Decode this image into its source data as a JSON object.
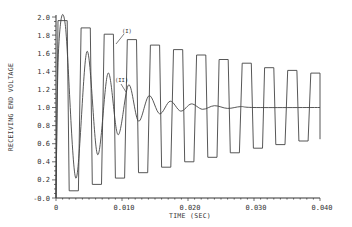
{
  "chart_data": {
    "type": "line",
    "title": "",
    "xlabel": "TIME (SEC)",
    "ylabel": "RECEIVING END VOLTAGE",
    "xlim": [
      0,
      0.04
    ],
    "ylim": [
      0.0,
      2.0
    ],
    "xticks": [
      "0",
      "0.010",
      "0.020",
      "0.030",
      "0.040"
    ],
    "xtick_values": [
      0,
      0.01,
      0.02,
      0.03,
      0.04
    ],
    "yticks": [
      "-0.0",
      "0.2",
      "0.4",
      "0.6",
      "0.8",
      "1.0",
      "1.2",
      "1.4",
      "1.6",
      "1.8",
      "2.0"
    ],
    "ytick_values": [
      0.0,
      0.2,
      0.4,
      0.6,
      0.8,
      1.0,
      1.2,
      1.4,
      1.6,
      1.8,
      2.0
    ],
    "grid": false,
    "legend": "none (inline annotations)",
    "annotations": [
      {
        "text": "(I)",
        "x": 0.0109,
        "y": 1.85,
        "points_to": "series I"
      },
      {
        "text": "(II)",
        "x": 0.011,
        "y": 1.27,
        "points_to": "series II"
      }
    ],
    "series": [
      {
        "name": "(I)",
        "description": "Undamped square-wave-like oscillation between high and low levels, slowly decaying toward 1.0",
        "period_sec": 0.00347,
        "peaks": [
          {
            "t": 0.001,
            "v": 1.96
          },
          {
            "t": 0.0045,
            "v": 1.88
          },
          {
            "t": 0.008,
            "v": 1.81
          },
          {
            "t": 0.0115,
            "v": 1.75
          },
          {
            "t": 0.015,
            "v": 1.69
          },
          {
            "t": 0.0185,
            "v": 1.64
          },
          {
            "t": 0.022,
            "v": 1.58
          },
          {
            "t": 0.0254,
            "v": 1.53
          },
          {
            "t": 0.0289,
            "v": 1.49
          },
          {
            "t": 0.0323,
            "v": 1.44
          },
          {
            "t": 0.0358,
            "v": 1.41
          },
          {
            "t": 0.0393,
            "v": 1.38
          }
        ],
        "troughs": [
          {
            "t": 0.0027,
            "v": 0.08
          },
          {
            "t": 0.0062,
            "v": 0.15
          },
          {
            "t": 0.0097,
            "v": 0.22
          },
          {
            "t": 0.0132,
            "v": 0.28
          },
          {
            "t": 0.0167,
            "v": 0.34
          },
          {
            "t": 0.0202,
            "v": 0.4
          },
          {
            "t": 0.0237,
            "v": 0.45
          },
          {
            "t": 0.0271,
            "v": 0.5
          },
          {
            "t": 0.0306,
            "v": 0.55
          },
          {
            "t": 0.034,
            "v": 0.59
          },
          {
            "t": 0.0375,
            "v": 0.63
          }
        ],
        "end": {
          "t": 0.04,
          "v": 0.65
        }
      },
      {
        "name": "(II)",
        "description": "Damped oscillation settling to 1.0",
        "points": [
          {
            "t": 0.0,
            "v": 0.0
          },
          {
            "t": 0.0004,
            "v": 1.65
          },
          {
            "t": 0.0014,
            "v": 1.92
          },
          {
            "t": 0.003,
            "v": 0.22
          },
          {
            "t": 0.0047,
            "v": 1.62
          },
          {
            "t": 0.0063,
            "v": 0.48
          },
          {
            "t": 0.0079,
            "v": 1.38
          },
          {
            "t": 0.0094,
            "v": 0.7
          },
          {
            "t": 0.011,
            "v": 1.25
          },
          {
            "t": 0.0125,
            "v": 0.85
          },
          {
            "t": 0.0141,
            "v": 1.13
          },
          {
            "t": 0.0157,
            "v": 0.93
          },
          {
            "t": 0.0173,
            "v": 1.07
          },
          {
            "t": 0.0189,
            "v": 0.96
          },
          {
            "t": 0.0205,
            "v": 1.04
          },
          {
            "t": 0.0222,
            "v": 0.98
          },
          {
            "t": 0.024,
            "v": 1.02
          },
          {
            "t": 0.026,
            "v": 0.99
          },
          {
            "t": 0.028,
            "v": 1.01
          },
          {
            "t": 0.03,
            "v": 1.0
          },
          {
            "t": 0.04,
            "v": 1.0
          }
        ]
      }
    ]
  },
  "colors": {
    "line": "#444444",
    "axis": "#333333",
    "background": "#ffffff"
  }
}
